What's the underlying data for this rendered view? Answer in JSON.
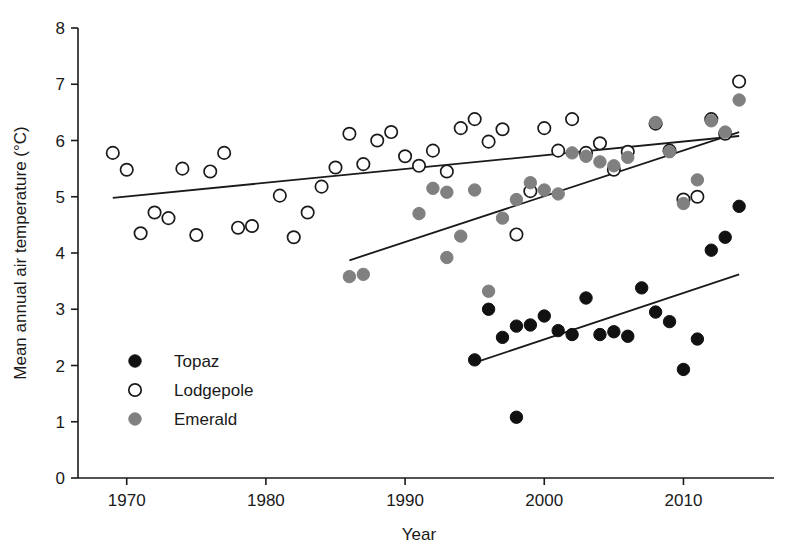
{
  "chart_data": {
    "type": "scatter",
    "title": "",
    "xlabel": "Year",
    "ylabel": "Mean annual air temperature (°C)",
    "xlim": [
      1966.5,
      2015.5
    ],
    "ylim": [
      0,
      8
    ],
    "xticks": [
      1970,
      1980,
      1990,
      2000,
      2010
    ],
    "xtick_labels": [
      "1970",
      "1980",
      "1990",
      "2000",
      "2010"
    ],
    "yticks": [
      0,
      1,
      2,
      3,
      4,
      5,
      6,
      7,
      8
    ],
    "ytick_labels": [
      "0",
      "1",
      "2",
      "3",
      "4",
      "5",
      "6",
      "7",
      "8"
    ],
    "grid": false,
    "legend_position": "lower-left-inside",
    "series": [
      {
        "name": "Topaz",
        "marker": "filled-circle",
        "color": "#111111",
        "edge_color": "#111111",
        "points": [
          {
            "x": 1995,
            "y": 2.1
          },
          {
            "x": 1996,
            "y": 3.0
          },
          {
            "x": 1997,
            "y": 2.5
          },
          {
            "x": 1998,
            "y": 1.08
          },
          {
            "x": 1998,
            "y": 2.7
          },
          {
            "x": 1999,
            "y": 2.72
          },
          {
            "x": 2000,
            "y": 2.88
          },
          {
            "x": 2001,
            "y": 2.62
          },
          {
            "x": 2002,
            "y": 2.55
          },
          {
            "x": 2003,
            "y": 3.2
          },
          {
            "x": 2004,
            "y": 2.55
          },
          {
            "x": 2005,
            "y": 2.6
          },
          {
            "x": 2006,
            "y": 2.52
          },
          {
            "x": 2007,
            "y": 3.38
          },
          {
            "x": 2008,
            "y": 2.95
          },
          {
            "x": 2009,
            "y": 2.78
          },
          {
            "x": 2010,
            "y": 1.93
          },
          {
            "x": 2011,
            "y": 2.47
          },
          {
            "x": 2012,
            "y": 4.05
          },
          {
            "x": 2013,
            "y": 4.28
          },
          {
            "x": 2014,
            "y": 4.83
          }
        ],
        "trend": {
          "x0": 1995,
          "y0": 2.05,
          "x1": 2014,
          "y1": 3.62
        }
      },
      {
        "name": "Lodgepole",
        "marker": "open-circle",
        "color": "#ffffff",
        "edge_color": "#1a1a1a",
        "points": [
          {
            "x": 1969,
            "y": 5.78
          },
          {
            "x": 1970,
            "y": 5.48
          },
          {
            "x": 1971,
            "y": 4.35
          },
          {
            "x": 1972,
            "y": 4.72
          },
          {
            "x": 1973,
            "y": 4.62
          },
          {
            "x": 1974,
            "y": 5.5
          },
          {
            "x": 1975,
            "y": 4.32
          },
          {
            "x": 1976,
            "y": 5.45
          },
          {
            "x": 1977,
            "y": 5.78
          },
          {
            "x": 1978,
            "y": 4.45
          },
          {
            "x": 1979,
            "y": 4.48
          },
          {
            "x": 1981,
            "y": 5.02
          },
          {
            "x": 1982,
            "y": 4.28
          },
          {
            "x": 1983,
            "y": 4.72
          },
          {
            "x": 1984,
            "y": 5.18
          },
          {
            "x": 1985,
            "y": 5.52
          },
          {
            "x": 1986,
            "y": 6.12
          },
          {
            "x": 1987,
            "y": 5.58
          },
          {
            "x": 1988,
            "y": 6.0
          },
          {
            "x": 1989,
            "y": 6.15
          },
          {
            "x": 1990,
            "y": 5.72
          },
          {
            "x": 1991,
            "y": 5.55
          },
          {
            "x": 1992,
            "y": 5.82
          },
          {
            "x": 1993,
            "y": 5.45
          },
          {
            "x": 1994,
            "y": 6.22
          },
          {
            "x": 1995,
            "y": 6.38
          },
          {
            "x": 1996,
            "y": 5.98
          },
          {
            "x": 1997,
            "y": 6.2
          },
          {
            "x": 1998,
            "y": 4.33
          },
          {
            "x": 1999,
            "y": 5.1
          },
          {
            "x": 2000,
            "y": 6.22
          },
          {
            "x": 2001,
            "y": 5.82
          },
          {
            "x": 2002,
            "y": 6.38
          },
          {
            "x": 2003,
            "y": 5.78
          },
          {
            "x": 2004,
            "y": 5.95
          },
          {
            "x": 2005,
            "y": 5.48
          },
          {
            "x": 2006,
            "y": 5.8
          },
          {
            "x": 2008,
            "y": 6.3
          },
          {
            "x": 2009,
            "y": 5.82
          },
          {
            "x": 2010,
            "y": 4.95
          },
          {
            "x": 2011,
            "y": 5.0
          },
          {
            "x": 2012,
            "y": 6.38
          },
          {
            "x": 2013,
            "y": 6.12
          },
          {
            "x": 2014,
            "y": 7.05
          }
        ],
        "trend": {
          "x0": 1969,
          "y0": 4.98,
          "x1": 2014,
          "y1": 6.08
        }
      },
      {
        "name": "Emerald",
        "marker": "filled-circle",
        "color": "#808080",
        "edge_color": "#808080",
        "points": [
          {
            "x": 1986,
            "y": 3.58
          },
          {
            "x": 1987,
            "y": 3.62
          },
          {
            "x": 1991,
            "y": 4.7
          },
          {
            "x": 1992,
            "y": 5.15
          },
          {
            "x": 1993,
            "y": 5.08
          },
          {
            "x": 1993,
            "y": 3.92
          },
          {
            "x": 1994,
            "y": 4.3
          },
          {
            "x": 1995,
            "y": 5.12
          },
          {
            "x": 1996,
            "y": 3.32
          },
          {
            "x": 1997,
            "y": 4.62
          },
          {
            "x": 1998,
            "y": 4.95
          },
          {
            "x": 1999,
            "y": 5.25
          },
          {
            "x": 2000,
            "y": 5.12
          },
          {
            "x": 2001,
            "y": 5.05
          },
          {
            "x": 2002,
            "y": 5.78
          },
          {
            "x": 2003,
            "y": 5.72
          },
          {
            "x": 2004,
            "y": 5.62
          },
          {
            "x": 2005,
            "y": 5.55
          },
          {
            "x": 2006,
            "y": 5.7
          },
          {
            "x": 2008,
            "y": 6.32
          },
          {
            "x": 2009,
            "y": 5.8
          },
          {
            "x": 2010,
            "y": 4.88
          },
          {
            "x": 2011,
            "y": 5.3
          },
          {
            "x": 2012,
            "y": 6.35
          },
          {
            "x": 2013,
            "y": 6.15
          },
          {
            "x": 2014,
            "y": 6.72
          }
        ],
        "trend": {
          "x0": 1986,
          "y0": 3.87,
          "x1": 2014,
          "y1": 6.15
        }
      }
    ]
  },
  "legend": {
    "items": [
      {
        "label": "Topaz",
        "marker": "filled-circle",
        "color": "#111111"
      },
      {
        "label": "Lodgepole",
        "marker": "open-circle",
        "color": "#ffffff"
      },
      {
        "label": "Emerald",
        "marker": "filled-circle",
        "color": "#808080"
      }
    ]
  }
}
